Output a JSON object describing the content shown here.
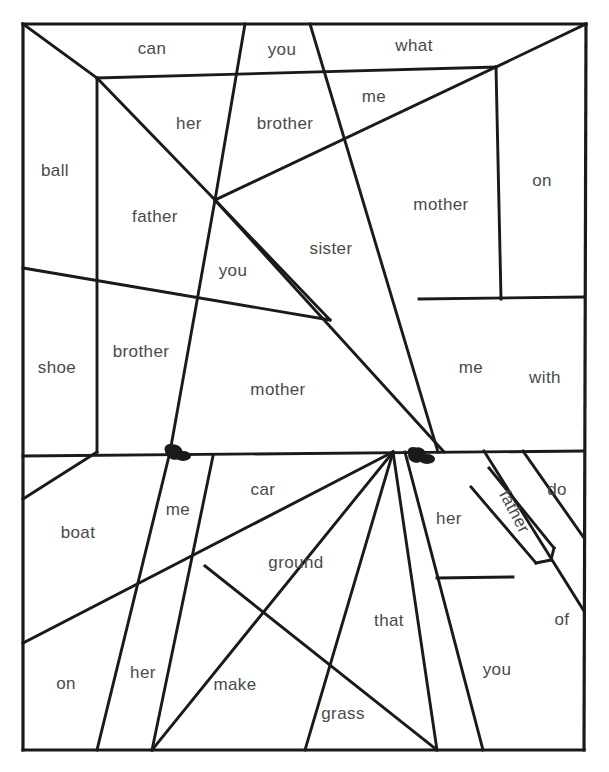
{
  "page": {
    "background_color": "#ffffff",
    "line_color": "#1a1a1a",
    "text_color": "#4a4a4a",
    "width": 609,
    "height": 772
  },
  "border": {
    "name": "outer-border-rectangle",
    "top_left": [
      23,
      24
    ],
    "top_right": [
      586,
      24
    ],
    "bottom_right": [
      584,
      750
    ],
    "bottom_left": [
      23,
      750
    ]
  },
  "marks": [
    {
      "name": "ink-blob-left",
      "cx": 174,
      "cy": 452
    },
    {
      "name": "ink-blob-right",
      "cx": 417,
      "cy": 455
    }
  ],
  "words": [
    {
      "id": "can",
      "text": "can",
      "x": 152,
      "y": 49,
      "rotate": 0
    },
    {
      "id": "you-top",
      "text": "you",
      "x": 282,
      "y": 50,
      "rotate": 0
    },
    {
      "id": "what",
      "text": "what",
      "x": 414,
      "y": 46,
      "rotate": 0
    },
    {
      "id": "me-top",
      "text": "me",
      "x": 374,
      "y": 97,
      "rotate": 0
    },
    {
      "id": "her-top",
      "text": "her",
      "x": 189,
      "y": 124,
      "rotate": 0
    },
    {
      "id": "brother1",
      "text": "brother",
      "x": 285,
      "y": 124,
      "rotate": 0
    },
    {
      "id": "ball",
      "text": "ball",
      "x": 55,
      "y": 171,
      "rotate": 0
    },
    {
      "id": "on-right",
      "text": "on",
      "x": 542,
      "y": 181,
      "rotate": 0
    },
    {
      "id": "mother1",
      "text": "mother",
      "x": 441,
      "y": 205,
      "rotate": 0
    },
    {
      "id": "father1",
      "text": "father",
      "x": 155,
      "y": 217,
      "rotate": 0
    },
    {
      "id": "sister",
      "text": "sister",
      "x": 331,
      "y": 249,
      "rotate": 0
    },
    {
      "id": "you-mid",
      "text": "you",
      "x": 233,
      "y": 271,
      "rotate": 0
    },
    {
      "id": "shoe",
      "text": "shoe",
      "x": 57,
      "y": 368,
      "rotate": 0
    },
    {
      "id": "brother2",
      "text": "brother",
      "x": 141,
      "y": 352,
      "rotate": 0
    },
    {
      "id": "me-right",
      "text": "me",
      "x": 471,
      "y": 368,
      "rotate": 0
    },
    {
      "id": "with",
      "text": "with",
      "x": 545,
      "y": 378,
      "rotate": 0
    },
    {
      "id": "mother2",
      "text": "mother",
      "x": 278,
      "y": 390,
      "rotate": 0
    },
    {
      "id": "car",
      "text": "car",
      "x": 263,
      "y": 490,
      "rotate": 0
    },
    {
      "id": "me-lower",
      "text": "me",
      "x": 178,
      "y": 510,
      "rotate": 0
    },
    {
      "id": "her-low1",
      "text": "her",
      "x": 449,
      "y": 519,
      "rotate": 0
    },
    {
      "id": "do",
      "text": "do",
      "x": 557,
      "y": 490,
      "rotate": 0
    },
    {
      "id": "father2",
      "text": "father",
      "x": 514,
      "y": 512,
      "rotate": 62
    },
    {
      "id": "boat",
      "text": "boat",
      "x": 78,
      "y": 533,
      "rotate": 0
    },
    {
      "id": "ground",
      "text": "ground",
      "x": 296,
      "y": 563,
      "rotate": 0
    },
    {
      "id": "that",
      "text": "that",
      "x": 389,
      "y": 621,
      "rotate": 0
    },
    {
      "id": "of",
      "text": "of",
      "x": 562,
      "y": 620,
      "rotate": 0
    },
    {
      "id": "you-low",
      "text": "you",
      "x": 497,
      "y": 670,
      "rotate": 0
    },
    {
      "id": "on-low",
      "text": "on",
      "x": 66,
      "y": 684,
      "rotate": 0
    },
    {
      "id": "her-low2",
      "text": "her",
      "x": 143,
      "y": 673,
      "rotate": 0
    },
    {
      "id": "make",
      "text": "make",
      "x": 235,
      "y": 685,
      "rotate": 0
    },
    {
      "id": "grass",
      "text": "grass",
      "x": 343,
      "y": 714,
      "rotate": 0
    }
  ],
  "lines": [
    {
      "id": "border-top",
      "pts": "23,24 586,24"
    },
    {
      "id": "border-right",
      "pts": "586,24 584,750"
    },
    {
      "id": "border-bottom",
      "pts": "584,750 23,750"
    },
    {
      "id": "border-left",
      "pts": "23,750 23,24"
    },
    {
      "id": "tl-diagonal",
      "pts": "23,24 97,78"
    },
    {
      "id": "tl-diag-ext",
      "pts": "97,78 215,200"
    },
    {
      "id": "horiz-upper",
      "pts": "97,78 496,67"
    },
    {
      "id": "tr-diagonal",
      "pts": "586,24 496,67"
    },
    {
      "id": "tr-diag-down",
      "pts": "496,67 215,200"
    },
    {
      "id": "vert-left-up",
      "pts": "97,78 97,452"
    },
    {
      "id": "vert-mid-on",
      "pts": "496,67 501,299"
    },
    {
      "id": "horiz-right",
      "pts": "419,299 584,297"
    },
    {
      "id": "you-can-div",
      "pts": "245,24 215,200"
    },
    {
      "id": "what-me-div",
      "pts": "310,24 438,452"
    },
    {
      "id": "sister-left",
      "pts": "215,200 330,320"
    },
    {
      "id": "mother-diag",
      "pts": "330,320 23,268"
    },
    {
      "id": "sister-right",
      "pts": "215,200 444,452"
    },
    {
      "id": "vert-brother2",
      "pts": "215,200 170,452"
    },
    {
      "id": "horiz-mid",
      "pts": "23,456 584,451"
    },
    {
      "id": "lowleft-diag",
      "pts": "97,452 23,499"
    },
    {
      "id": "lowleft-long",
      "pts": "23,643 393,452"
    },
    {
      "id": "low-me-div",
      "pts": "170,452 97,750"
    },
    {
      "id": "low-her-div",
      "pts": "213,456 152,750"
    },
    {
      "id": "low-car-div",
      "pts": "393,452 152,750"
    },
    {
      "id": "low-ground",
      "pts": "393,452 305,750"
    },
    {
      "id": "low-that-div",
      "pts": "393,452 437,750"
    },
    {
      "id": "low-grass",
      "pts": "205,566 437,750"
    },
    {
      "id": "low-her-right",
      "pts": "405,452 483,750"
    },
    {
      "id": "low-you-div",
      "pts": "437,578 513,577"
    },
    {
      "id": "low-of-div",
      "pts": "484,451 584,611"
    },
    {
      "id": "low-do-div",
      "pts": "523,451 584,538"
    },
    {
      "id": "father-side-a",
      "pts": "489,468 554,548"
    },
    {
      "id": "father-side-b",
      "pts": "471,487 536,563"
    },
    {
      "id": "father-notch1",
      "pts": "554,548 551,560"
    },
    {
      "id": "father-notch2",
      "pts": "551,560 536,563"
    }
  ]
}
